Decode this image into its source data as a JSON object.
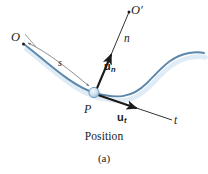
{
  "figure": {
    "caption": "Position",
    "subfigure_label": "(a)",
    "background_color": "#ffffff",
    "curve_color": "#5b87ad",
    "curve_shadow_color": "#bcd4e6",
    "axis_color": "#1b1b1b",
    "arc_color": "#7a7a7a",
    "point_fill_color": "#cfe2ef",
    "point_stroke_color": "#5b87ad"
  },
  "labels": {
    "origin": "O",
    "center_of_curvature": "O′",
    "normal_axis": "n",
    "tangent_axis": "t",
    "arc_length": "s",
    "particle_point": "P",
    "unit_normal_base": "u",
    "unit_normal_sub": "n",
    "unit_tangent_base": "u",
    "unit_tangent_sub": "t"
  },
  "geometry": {
    "point_P": {
      "x": 95,
      "y": 94
    },
    "point_O": {
      "x": 23,
      "y": 44
    },
    "point_Oprime": {
      "x": 128,
      "y": 13
    },
    "normal_axis_end": {
      "x": 130,
      "y": 11
    },
    "tangent_axis_end": {
      "x": 172,
      "y": 119
    },
    "unit_normal_arrow_tip": {
      "x": 112,
      "y": 51
    },
    "unit_tangent_arrow_tip": {
      "x": 139,
      "y": 107
    }
  }
}
